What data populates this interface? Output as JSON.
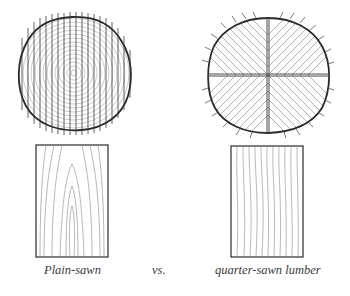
{
  "figure": {
    "panels": [
      {
        "id": "plain-sawn",
        "log_section": "log cross-section with parallel vertical saw cuts through concentric growth rings",
        "board_face": "board face showing cathedral (arched) grain pattern"
      },
      {
        "id": "quarter-sawn",
        "log_section": "log quartered into four sections with radial saw cuts",
        "board_face": "board face showing straight vertical grain"
      }
    ]
  },
  "captions": {
    "left": "Plain-sawn",
    "middle": "vs.",
    "right": "quarter-sawn lumber"
  },
  "colors": {
    "ink": "#2a2a2a",
    "grain": "#7a7a7a",
    "background": "#ffffff"
  }
}
